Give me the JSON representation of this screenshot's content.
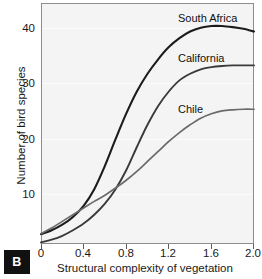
{
  "panel": {
    "label": "B"
  },
  "axes": {
    "xlabel": "Structural complexity of vegetation",
    "ylabel": "Number of bird species",
    "xticks": [
      "0",
      "0.4",
      "0.8",
      "1.2",
      "1.6",
      "2.0"
    ],
    "yticks": [
      "40",
      "30",
      "20",
      "10"
    ]
  },
  "annotations": {
    "south_africa": "South Africa",
    "california": "California",
    "chile": "Chile"
  },
  "colors": {
    "south_africa": "#1c1c1c",
    "california": "#3a3a3a",
    "chile": "#6a6a6a",
    "plot_background": "#f4f4f4",
    "gridline": "#fbfbfb",
    "frame": "#8d8d8d",
    "badge_background": "#111111",
    "badge_text": "#ffffff"
  },
  "chart_data": {
    "type": "line",
    "title": "",
    "subtitle": "",
    "xlabel": "Structural complexity of vegetation",
    "ylabel": "Number of bird species",
    "xlim": [
      0,
      2.0
    ],
    "ylim": [
      0,
      44
    ],
    "xticks": [
      0,
      0.4,
      0.8,
      1.2,
      1.6,
      2.0
    ],
    "yticks": [
      10,
      20,
      30,
      40
    ],
    "grid": true,
    "legend": "inline-curve-labels",
    "series": [
      {
        "name": "South Africa",
        "color": "#1c1c1c",
        "x": [
          0.0,
          0.1,
          0.2,
          0.3,
          0.4,
          0.5,
          0.6,
          0.7,
          0.8,
          0.9,
          1.0,
          1.1,
          1.2,
          1.3,
          1.4,
          1.5,
          1.6,
          1.7,
          1.8,
          1.9,
          2.0
        ],
        "values": [
          2.5,
          3.2,
          4.2,
          5.6,
          7.6,
          10.6,
          14.8,
          19.6,
          24.2,
          28.2,
          31.4,
          34.0,
          36.2,
          37.8,
          39.0,
          39.7,
          40.0,
          40.0,
          39.8,
          39.5,
          39.0
        ]
      },
      {
        "name": "California",
        "color": "#3a3a3a",
        "x": [
          0.0,
          0.1,
          0.2,
          0.3,
          0.4,
          0.5,
          0.6,
          0.7,
          0.8,
          0.9,
          1.0,
          1.1,
          1.2,
          1.3,
          1.4,
          1.5,
          1.6,
          1.7,
          1.8,
          1.9,
          2.0
        ],
        "values": [
          1.0,
          1.5,
          2.2,
          3.2,
          4.4,
          6.0,
          8.0,
          10.6,
          14.0,
          18.2,
          22.2,
          25.6,
          28.2,
          30.2,
          31.4,
          32.2,
          32.6,
          32.8,
          32.9,
          32.9,
          32.9
        ]
      },
      {
        "name": "Chile",
        "color": "#6a6a6a",
        "x": [
          0.0,
          0.1,
          0.2,
          0.3,
          0.4,
          0.5,
          0.6,
          0.7,
          0.8,
          0.9,
          1.0,
          1.1,
          1.2,
          1.3,
          1.4,
          1.5,
          1.6,
          1.7,
          1.8,
          1.9,
          2.0
        ],
        "values": [
          2.6,
          3.6,
          4.8,
          6.0,
          7.2,
          8.4,
          9.5,
          10.8,
          12.2,
          13.8,
          15.6,
          17.4,
          19.2,
          20.8,
          22.2,
          23.4,
          24.2,
          24.7,
          24.9,
          25.0,
          25.0
        ]
      }
    ]
  },
  "geometry": {
    "plot_left": 41,
    "plot_top": 3,
    "plot_width": 213,
    "plot_height": 241,
    "y_zero_px": 248,
    "y_per_unit_px": 5.55
  }
}
